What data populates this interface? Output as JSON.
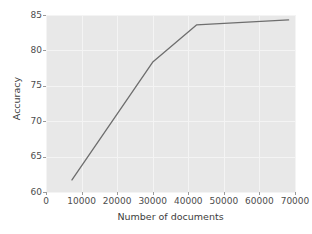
{
  "chart_data": {
    "type": "line",
    "title": "",
    "xlabel": "Number of documents",
    "ylabel": "Accuracy",
    "xlim": [
      0,
      70000
    ],
    "ylim": [
      60,
      85
    ],
    "xticks": [
      0,
      10000,
      20000,
      30000,
      40000,
      50000,
      60000,
      70000
    ],
    "xtick_labels": [
      "0",
      "10000",
      "20000",
      "30000",
      "40000",
      "50000",
      "60000",
      "70000"
    ],
    "yticks": [
      60,
      65,
      70,
      75,
      80,
      85
    ],
    "ytick_labels": [
      "60",
      "65",
      "70",
      "75",
      "80",
      "85"
    ],
    "grid": true,
    "legend": null,
    "series": [
      {
        "name": "accuracy",
        "color": "#6e6e6e",
        "x": [
          7300,
          30100,
          42300,
          68200
        ],
        "y": [
          61.7,
          78.4,
          83.6,
          84.3
        ]
      }
    ]
  },
  "style": {
    "axes_facecolor": "#e8e8e8",
    "figure_facecolor": "#ffffff",
    "grid_color": "#f4f4f4",
    "tick_color": "#4d4d4d",
    "line_color": "#6e6e6e"
  }
}
